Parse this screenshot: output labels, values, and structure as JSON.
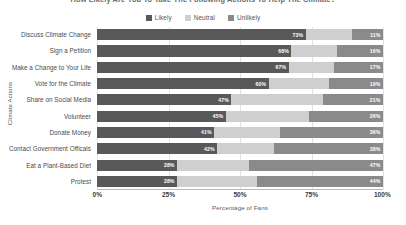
{
  "title": "How Likely Are You To Take The Following Actions To Help The Climate?",
  "legend": {
    "position": "top-center",
    "items": [
      {
        "label": "Likely",
        "color": "#595959"
      },
      {
        "label": "Neutral",
        "color": "#cfcfcf"
      },
      {
        "label": "Unlikely",
        "color": "#8a8a8a"
      }
    ]
  },
  "axes": {
    "x_title": "Percentage of Fans",
    "y_title": "Climate Actions",
    "x_ticks": [
      "0%",
      "25%",
      "50%",
      "75%",
      "100%"
    ]
  },
  "chart_data": {
    "type": "bar",
    "orientation": "horizontal",
    "stacked": true,
    "title": "How Likely Are You To Take The Following Actions To Help The Climate?",
    "xlabel": "Percentage of Fans",
    "ylabel": "Climate Actions",
    "xlim": [
      0,
      100
    ],
    "xticks": [
      0,
      25,
      50,
      75,
      100
    ],
    "xtick_labels": [
      "0%",
      "25%",
      "50%",
      "75%",
      "100%"
    ],
    "grid": true,
    "legend_position": "top-center",
    "categories": [
      "Discuss Climate Change",
      "Sign a Petition",
      "Make a Change to Your Life",
      "Vote for the Climate",
      "Share on Social Media",
      "Volunteer",
      "Donate Money",
      "Contact Government Officals",
      "Eat a Plant-Based Diet",
      "Protest"
    ],
    "series": [
      {
        "name": "Likely",
        "color": "#595959",
        "values": [
          73,
          68,
          67,
          60,
          47,
          45,
          41,
          42,
          28,
          28
        ],
        "labels": [
          "73%",
          "68%",
          "67%",
          "60%",
          "47%",
          "45%",
          "41%",
          "42%",
          "28%",
          "28%"
        ]
      },
      {
        "name": "Neutral",
        "color": "#cfcfcf",
        "values": [
          16,
          16,
          16,
          21,
          32,
          29,
          23,
          20,
          25,
          28
        ],
        "labels": [
          "",
          "",
          "",
          "",
          "",
          "",
          "",
          "",
          "",
          ""
        ]
      },
      {
        "name": "Unlikely",
        "color": "#8a8a8a",
        "values": [
          11,
          16,
          17,
          19,
          21,
          26,
          36,
          38,
          47,
          44
        ],
        "labels": [
          "11%",
          "16%",
          "17%",
          "19%",
          "21%",
          "26%",
          "36%",
          "38%",
          "47%",
          "44%"
        ]
      }
    ]
  }
}
